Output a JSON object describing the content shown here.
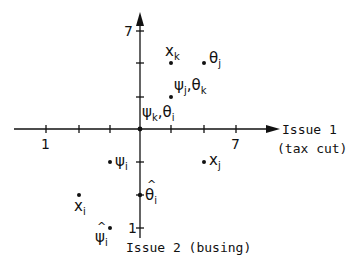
{
  "diagram": {
    "axes": {
      "x": {
        "title_line1": "Issue 1",
        "title_line2": "(tax cut)",
        "tick_label_left": "1",
        "tick_label_right": "7"
      },
      "y": {
        "title": "Issue 2 (busing)",
        "tick_label_top": "7",
        "tick_label_bottom": "1"
      }
    },
    "points": [
      {
        "id": "x_k",
        "base": "x",
        "sub": "k",
        "grid": [
          1,
          2
        ]
      },
      {
        "id": "theta_j",
        "base": "θ",
        "sub": "j",
        "grid": [
          2,
          2
        ]
      },
      {
        "id": "psi_j_theta_k",
        "base1": "ψ",
        "sub1": "j",
        "sep": ",",
        "base2": "θ",
        "sub2": "k",
        "grid": [
          1,
          1
        ]
      },
      {
        "id": "psi_k_theta_i",
        "base1": "ψ",
        "sub1": "k",
        "sep": ",",
        "base2": "θ",
        "sub2": "i",
        "grid": [
          0,
          0
        ]
      },
      {
        "id": "psi_i",
        "base": "ψ",
        "sub": "i",
        "grid": [
          -1,
          -1
        ]
      },
      {
        "id": "x_j",
        "base": "x",
        "sub": "j",
        "grid": [
          2,
          -1
        ]
      },
      {
        "id": "x_i",
        "base": "x",
        "sub": "i",
        "grid": [
          -2,
          -2
        ]
      },
      {
        "id": "theta_hat_i",
        "base": "θ",
        "sub": "i",
        "hat": true,
        "grid": [
          0,
          -2
        ]
      },
      {
        "id": "psi_hat_i",
        "base": "ψ",
        "sub": "i",
        "hat": true,
        "grid": [
          -1,
          -3
        ]
      }
    ]
  }
}
